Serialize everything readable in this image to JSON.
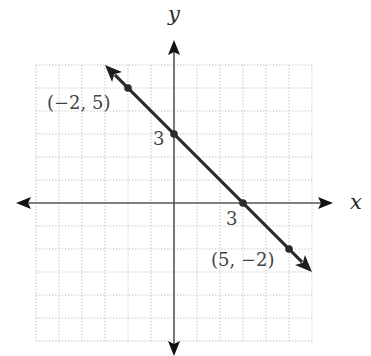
{
  "chart_data": {
    "type": "line",
    "title": "",
    "xlabel": "x",
    "ylabel": "y",
    "xlim": [
      -6,
      6
    ],
    "ylim": [
      -6,
      6
    ],
    "grid": true,
    "grid_step": 1,
    "equation": "y = -x + 3",
    "series": [
      {
        "name": "line",
        "x": [
          -3,
          6
        ],
        "y": [
          6,
          -3
        ],
        "arrows_both_ends": true
      }
    ],
    "points": [
      {
        "x": -2,
        "y": 5,
        "label": "(−2, 5)"
      },
      {
        "x": 0,
        "y": 3,
        "label": "3"
      },
      {
        "x": 3,
        "y": 0,
        "label": "3"
      },
      {
        "x": 5,
        "y": -2,
        "label": "(5, −2)"
      }
    ]
  },
  "labels": {
    "x_axis": "x",
    "y_axis": "y",
    "point_a": "(−2, 5)",
    "point_b": "(5, −2)",
    "y_intercept": "3",
    "x_intercept": "3"
  }
}
